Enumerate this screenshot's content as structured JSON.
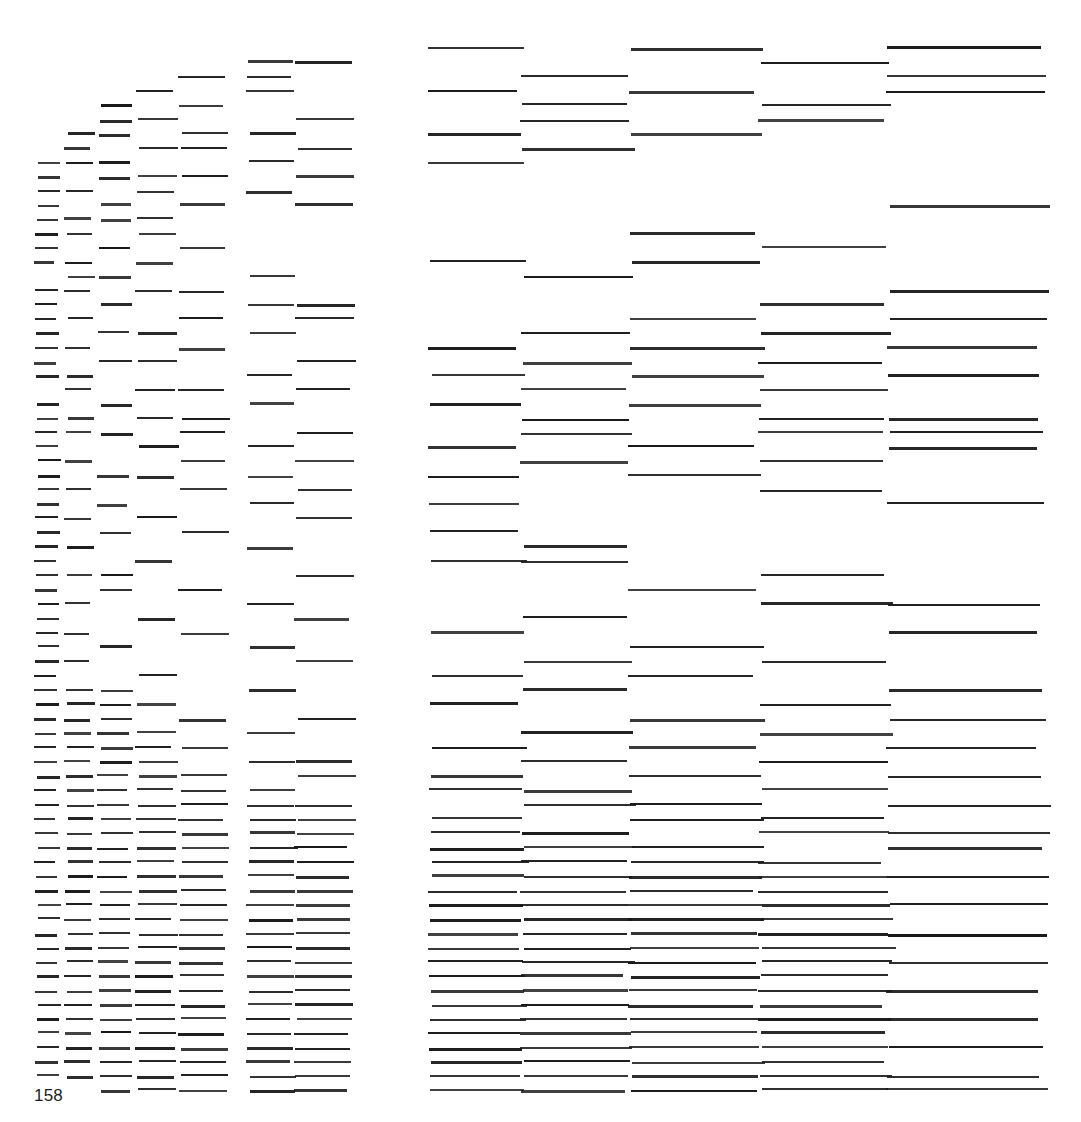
{
  "page": {
    "folio": "158",
    "background_color": "#ffffff",
    "ink_color": "#1a1a1a",
    "width": 1081,
    "height": 1122
  },
  "artwork": {
    "title": "",
    "description": "Grid of horizontal dashes arranged in ten vertical columns whose dash lengths increase from left to right, forming cascading diagonal bands.",
    "column_count": 10,
    "row_count": 62,
    "columns": [
      {
        "index": 1,
        "x": 36,
        "width": 22
      },
      {
        "index": 2,
        "x": 66,
        "width": 26
      },
      {
        "index": 3,
        "x": 99,
        "width": 31
      },
      {
        "index": 4,
        "x": 137,
        "width": 38
      },
      {
        "index": 5,
        "x": 180,
        "width": 46
      },
      {
        "index": 6,
        "x": 248,
        "width": 46
      },
      {
        "index": 7,
        "x": 296,
        "width": 56
      },
      {
        "index": 8,
        "x": 430,
        "width": 92
      },
      {
        "index": 9,
        "x": 522,
        "width": 108
      },
      {
        "index": 10,
        "x": 630,
        "width": 130
      },
      {
        "index": 11,
        "x": 760,
        "width": 128
      },
      {
        "index": 12,
        "x": 888,
        "width": 155
      }
    ],
    "rows": [
      {
        "y": 47,
        "cells": [
          8,
          10,
          12
        ]
      },
      {
        "y": 61,
        "cells": [
          6,
          7,
          11
        ]
      },
      {
        "y": 76,
        "cells": [
          5,
          6,
          9,
          12
        ]
      },
      {
        "y": 90,
        "cells": [
          4,
          6,
          8,
          10,
          12
        ]
      },
      {
        "y": 104,
        "cells": [
          3,
          5,
          9,
          11
        ]
      },
      {
        "y": 119,
        "cells": [
          3,
          4,
          7,
          9,
          11
        ]
      },
      {
        "y": 133,
        "cells": [
          2,
          3,
          5,
          6,
          8,
          10
        ]
      },
      {
        "y": 147,
        "cells": [
          2,
          4,
          5,
          7,
          9
        ]
      },
      {
        "y": 161,
        "cells": [
          1,
          2,
          3,
          6,
          8
        ]
      },
      {
        "y": 176,
        "cells": [
          1,
          3,
          4,
          5,
          7
        ]
      },
      {
        "y": 190,
        "cells": [
          1,
          2,
          4,
          6
        ]
      },
      {
        "y": 204,
        "cells": [
          1,
          3,
          5,
          7,
          12
        ]
      },
      {
        "y": 218,
        "cells": [
          1,
          2,
          3,
          4
        ]
      },
      {
        "y": 232,
        "cells": [
          1,
          2,
          4,
          10
        ]
      },
      {
        "y": 247,
        "cells": [
          1,
          3,
          5,
          11
        ]
      },
      {
        "y": 261,
        "cells": [
          1,
          2,
          4,
          8,
          10
        ]
      },
      {
        "y": 275,
        "cells": [
          2,
          3,
          6,
          9
        ]
      },
      {
        "y": 290,
        "cells": [
          1,
          2,
          4,
          5,
          12
        ]
      },
      {
        "y": 304,
        "cells": [
          1,
          3,
          6,
          7,
          11
        ]
      },
      {
        "y": 318,
        "cells": [
          1,
          2,
          5,
          7,
          10,
          12
        ]
      },
      {
        "y": 332,
        "cells": [
          1,
          3,
          4,
          6,
          9,
          11
        ]
      },
      {
        "y": 347,
        "cells": [
          1,
          2,
          5,
          8,
          10,
          12
        ]
      },
      {
        "y": 361,
        "cells": [
          1,
          3,
          4,
          7,
          9,
          11
        ]
      },
      {
        "y": 375,
        "cells": [
          1,
          2,
          6,
          8,
          10,
          12
        ]
      },
      {
        "y": 389,
        "cells": [
          2,
          4,
          5,
          7,
          9,
          11
        ]
      },
      {
        "y": 403,
        "cells": [
          1,
          3,
          6,
          8,
          10
        ]
      },
      {
        "y": 418,
        "cells": [
          1,
          2,
          4,
          5,
          9,
          11,
          12
        ]
      },
      {
        "y": 432,
        "cells": [
          1,
          2,
          3,
          5,
          7,
          9,
          11,
          12
        ]
      },
      {
        "y": 446,
        "cells": [
          1,
          4,
          6,
          8,
          10,
          12
        ]
      },
      {
        "y": 460,
        "cells": [
          1,
          2,
          5,
          7,
          9,
          11
        ]
      },
      {
        "y": 475,
        "cells": [
          1,
          3,
          4,
          6,
          8,
          10
        ]
      },
      {
        "y": 489,
        "cells": [
          1,
          2,
          5,
          7,
          11
        ]
      },
      {
        "y": 503,
        "cells": [
          1,
          3,
          6,
          8,
          12
        ]
      },
      {
        "y": 517,
        "cells": [
          1,
          2,
          4,
          7
        ]
      },
      {
        "y": 531,
        "cells": [
          1,
          3,
          5,
          8
        ]
      },
      {
        "y": 546,
        "cells": [
          1,
          2,
          6,
          9
        ]
      },
      {
        "y": 560,
        "cells": [
          1,
          4,
          8,
          9
        ]
      },
      {
        "y": 574,
        "cells": [
          1,
          2,
          3,
          7,
          11
        ]
      },
      {
        "y": 589,
        "cells": [
          1,
          3,
          5,
          10
        ]
      },
      {
        "y": 603,
        "cells": [
          1,
          2,
          6,
          11,
          12
        ]
      },
      {
        "y": 617,
        "cells": [
          1,
          4,
          7,
          9
        ]
      },
      {
        "y": 632,
        "cells": [
          1,
          2,
          5,
          8,
          12
        ]
      },
      {
        "y": 646,
        "cells": [
          1,
          3,
          6,
          10
        ]
      },
      {
        "y": 660,
        "cells": [
          1,
          2,
          7,
          9,
          11
        ]
      },
      {
        "y": 675,
        "cells": [
          1,
          4,
          8,
          10
        ]
      },
      {
        "y": 689,
        "cells": [
          1,
          2,
          3,
          6,
          9,
          12
        ]
      },
      {
        "y": 703,
        "cells": [
          1,
          2,
          3,
          4,
          8,
          11
        ]
      },
      {
        "y": 718,
        "cells": [
          1,
          2,
          3,
          5,
          7,
          10,
          12
        ]
      },
      {
        "y": 732,
        "cells": [
          1,
          2,
          3,
          4,
          6,
          9,
          11
        ]
      },
      {
        "y": 746,
        "cells": [
          1,
          2,
          3,
          4,
          5,
          8,
          10,
          12
        ]
      },
      {
        "y": 761,
        "cells": [
          1,
          2,
          3,
          4,
          6,
          7,
          9,
          11
        ]
      },
      {
        "y": 775,
        "cells": [
          1,
          2,
          3,
          4,
          5,
          7,
          8,
          10,
          12
        ]
      },
      {
        "y": 789,
        "cells": [
          1,
          2,
          3,
          4,
          5,
          6,
          8,
          9,
          11
        ]
      },
      {
        "y": 804,
        "cells": [
          1,
          2,
          3,
          4,
          5,
          6,
          7,
          9,
          10,
          12
        ]
      },
      {
        "y": 818,
        "cells": [
          1,
          2,
          3,
          4,
          5,
          6,
          7,
          8,
          10,
          11
        ]
      },
      {
        "y": 832,
        "cells": [
          1,
          2,
          3,
          4,
          5,
          6,
          7,
          8,
          9,
          11,
          12
        ]
      },
      {
        "y": 847,
        "cells": [
          1,
          2,
          3,
          4,
          5,
          6,
          7,
          8,
          9,
          10,
          12
        ]
      },
      {
        "y": 861,
        "cells": [
          1,
          2,
          3,
          4,
          5,
          6,
          7,
          8,
          9,
          10,
          11
        ]
      },
      {
        "y": 875,
        "cells": [
          1,
          2,
          3,
          4,
          5,
          6,
          7,
          8,
          9,
          10,
          11,
          12
        ]
      },
      {
        "y": 890,
        "cells": [
          1,
          2,
          3,
          4,
          5,
          6,
          7,
          8,
          9,
          10,
          11
        ]
      },
      {
        "y": 904,
        "cells": [
          1,
          2,
          3,
          4,
          5,
          6,
          7,
          8,
          9,
          10,
          11,
          12
        ]
      },
      {
        "y": 918,
        "cells": [
          1,
          2,
          3,
          4,
          5,
          6,
          7,
          8,
          9,
          10,
          11
        ]
      },
      {
        "y": 933,
        "cells": [
          1,
          2,
          3,
          4,
          5,
          6,
          7,
          8,
          9,
          10,
          11,
          12
        ]
      },
      {
        "y": 947,
        "cells": [
          1,
          2,
          3,
          4,
          5,
          6,
          7,
          8,
          9,
          10,
          11
        ]
      },
      {
        "y": 961,
        "cells": [
          1,
          2,
          3,
          4,
          5,
          6,
          7,
          8,
          9,
          10,
          11,
          12
        ]
      },
      {
        "y": 975,
        "cells": [
          1,
          2,
          3,
          4,
          5,
          6,
          7,
          8,
          9,
          10,
          11
        ]
      },
      {
        "y": 990,
        "cells": [
          1,
          2,
          3,
          4,
          5,
          6,
          7,
          8,
          9,
          10,
          11,
          12
        ]
      },
      {
        "y": 1004,
        "cells": [
          1,
          2,
          3,
          4,
          5,
          6,
          7,
          8,
          9,
          10,
          11
        ]
      },
      {
        "y": 1018,
        "cells": [
          1,
          2,
          3,
          4,
          5,
          6,
          7,
          8,
          9,
          10,
          11,
          12
        ]
      },
      {
        "y": 1032,
        "cells": [
          1,
          2,
          3,
          4,
          5,
          6,
          7,
          8,
          9,
          10,
          11
        ]
      },
      {
        "y": 1047,
        "cells": [
          1,
          2,
          3,
          4,
          5,
          6,
          7,
          8,
          9,
          10,
          11,
          12
        ]
      },
      {
        "y": 1061,
        "cells": [
          1,
          2,
          3,
          4,
          5,
          6,
          7,
          8,
          9,
          10,
          11
        ]
      },
      {
        "y": 1075,
        "cells": [
          1,
          2,
          3,
          4,
          5,
          6,
          7,
          8,
          9,
          10,
          11,
          12
        ]
      },
      {
        "y": 1089,
        "cells": [
          3,
          4,
          5,
          6,
          7,
          8,
          9,
          10,
          11,
          12
        ]
      }
    ]
  }
}
